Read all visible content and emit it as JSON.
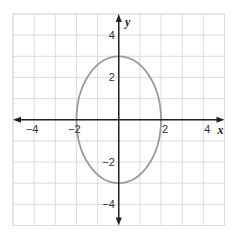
{
  "chart_data": {
    "type": "line",
    "title": "",
    "xlabel": "x",
    "ylabel": "y",
    "xlim": [
      -5,
      5
    ],
    "ylim": [
      -5,
      5
    ],
    "grid": true,
    "grid_step": 1,
    "x_ticks": [
      {
        "value": -4,
        "label": "−4"
      },
      {
        "value": -2,
        "label": "−2"
      },
      {
        "value": 2,
        "label": "2"
      },
      {
        "value": 4,
        "label": "4"
      }
    ],
    "y_ticks": [
      {
        "value": 4,
        "label": "4"
      },
      {
        "value": 2,
        "label": "2"
      },
      {
        "value": -2,
        "label": "−2"
      },
      {
        "value": -4,
        "label": "−4"
      }
    ],
    "series": [
      {
        "name": "ellipse",
        "shape": "ellipse",
        "equation": "x^2/4 + y^2/9 = 1",
        "center": [
          0,
          0
        ],
        "semi_axis_x": 2,
        "semi_axis_y": 3,
        "key_points": [
          [
            2,
            0
          ],
          [
            0,
            3
          ],
          [
            -2,
            0
          ],
          [
            0,
            -3
          ]
        ],
        "color": "#9a9a9a"
      }
    ],
    "legend": null
  },
  "colors": {
    "grid": "#dcdcdc",
    "axis": "#222222",
    "curve": "#9a9a9a",
    "background": "#ffffff"
  }
}
